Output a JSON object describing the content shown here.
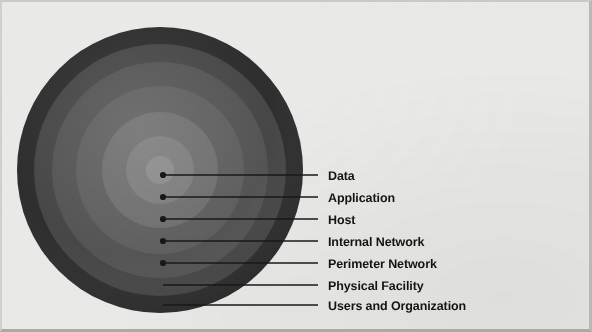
{
  "figure": {
    "name": "defense-in-depth-layers",
    "background_color": "#eaeae8",
    "line_color": "#181818",
    "text_color": "#141414"
  },
  "circle": {
    "center_x": 160,
    "center_y": 170,
    "outer_radius": 143
  },
  "layers": [
    {
      "label": "Data",
      "radius": 14,
      "color": "#8c8c8c",
      "dot_x": 163,
      "dot_y": 175,
      "line_end_x": 318,
      "has_dot": true,
      "label_x": 328,
      "label_y": 170
    },
    {
      "label": "Application",
      "radius": 34,
      "color": "#7e7e7e",
      "dot_x": 163,
      "dot_y": 197,
      "line_end_x": 318,
      "has_dot": true,
      "label_x": 328,
      "label_y": 192
    },
    {
      "label": "Host",
      "radius": 58,
      "color": "#6f6f6f",
      "dot_x": 163,
      "dot_y": 219,
      "line_end_x": 318,
      "has_dot": true,
      "label_x": 328,
      "label_y": 214
    },
    {
      "label": "Internal Network",
      "radius": 84,
      "color": "#606060",
      "dot_x": 163,
      "dot_y": 241,
      "line_end_x": 318,
      "has_dot": true,
      "label_x": 328,
      "label_y": 236
    },
    {
      "label": "Perimeter Network",
      "radius": 108,
      "color": "#555555",
      "dot_x": 163,
      "dot_y": 263,
      "line_end_x": 318,
      "has_dot": true,
      "label_x": 328,
      "label_y": 258
    },
    {
      "label": "Physical Facility",
      "radius": 126,
      "color": "#464646",
      "dot_x": 163,
      "dot_y": 285,
      "line_end_x": 318,
      "has_dot": false,
      "label_x": 328,
      "label_y": 280
    },
    {
      "label": "Users and Organization",
      "radius": 143,
      "color": "#2f2f2f",
      "dot_x": 163,
      "dot_y": 305,
      "line_end_x": 318,
      "has_dot": false,
      "label_x": 328,
      "label_y": 300
    }
  ],
  "chart_data": {
    "type": "pie",
    "title": "",
    "subtitle": "",
    "xlabel": "",
    "ylabel": "",
    "legend_position": "right",
    "grid": false,
    "categories": [
      "Data",
      "Application",
      "Host",
      "Internal Network",
      "Perimeter Network",
      "Physical Facility",
      "Users and Organization"
    ],
    "values": [
      14,
      34,
      58,
      84,
      108,
      126,
      143
    ],
    "value_unit": "radius-px"
  }
}
